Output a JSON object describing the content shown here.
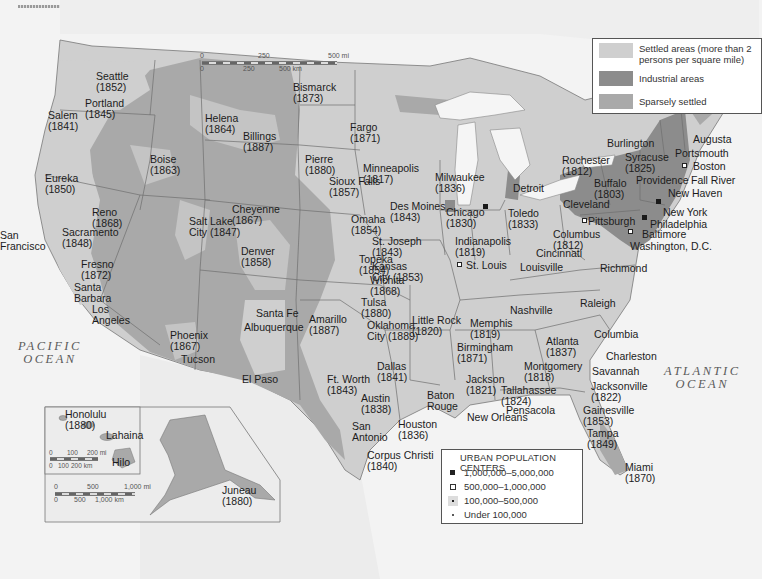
{
  "map": {
    "subject": "United States urban population centers and settlement",
    "colors": {
      "background": "#f3f3f3",
      "land_foreign": "#e8e8e8",
      "settled": "#cfcfcf",
      "industrial": "#8c8c8c",
      "sparsely": "#a9a9a9",
      "borders": "#6f6f6f",
      "lakes": "#f5f5f5"
    }
  },
  "oceans": {
    "pacific": "PACIFIC\nOCEAN",
    "atlantic": "ATLANTIC\nOCEAN"
  },
  "legend_settlement": {
    "items": [
      {
        "label": "Settled areas (more than 2\npersons per square mile)",
        "swatch": "#cfcfcf"
      },
      {
        "label": "Industrial areas",
        "swatch": "#8c8c8c"
      },
      {
        "label": "Sparsely settled",
        "swatch": "#a9a9a9"
      }
    ]
  },
  "legend_urban": {
    "title": "URBAN POPULATION CENTERS",
    "items": [
      {
        "label": "1,000,000–5,000,000",
        "symbol": "filled-square"
      },
      {
        "label": "500,000–1,000,000",
        "symbol": "open-square"
      },
      {
        "label": "100,000–500,000",
        "symbol": "dot-in-square"
      },
      {
        "label": "Under 100,000",
        "symbol": "dot"
      }
    ]
  },
  "scale_main": {
    "mi_ticks": [
      "0",
      "250",
      "500 mi"
    ],
    "km_ticks": [
      "0",
      "250",
      "500 km"
    ]
  },
  "inset_hawaii": {
    "mi_ticks": [
      "0",
      "100",
      "200 mi"
    ],
    "km_ticks": [
      "0",
      "100",
      "200 km"
    ]
  },
  "inset_alaska": {
    "mi_ticks": [
      "0",
      "500",
      "1,000 mi"
    ],
    "km_ticks": [
      "0",
      "500",
      "1,000 km"
    ]
  },
  "cities": [
    {
      "name": "Seattle\n(1852)",
      "x": 96,
      "y": 71
    },
    {
      "name": "Portland\n(1845)",
      "x": 85,
      "y": 98
    },
    {
      "name": "Salem\n(1841)",
      "x": 48,
      "y": 110
    },
    {
      "name": "Eureka\n(1850)",
      "x": 45,
      "y": 173
    },
    {
      "name": "Boise\n(1863)",
      "x": 150,
      "y": 154
    },
    {
      "name": "Helena\n(1864)",
      "x": 205,
      "y": 113
    },
    {
      "name": "Billings\n(1887)",
      "x": 243,
      "y": 131
    },
    {
      "name": "Bismarck\n(1873)",
      "x": 293,
      "y": 82
    },
    {
      "name": "Fargo\n(1871)",
      "x": 350,
      "y": 122
    },
    {
      "name": "Pierre\n(1880)",
      "x": 305,
      "y": 154
    },
    {
      "name": "Sioux Falls\n(1857)",
      "x": 329,
      "y": 176
    },
    {
      "name": "Minneapolis\n(1817)",
      "x": 363,
      "y": 163
    },
    {
      "name": "Milwaukee\n(1836)",
      "x": 435,
      "y": 172
    },
    {
      "name": "Des Moines\n(1843)",
      "x": 390,
      "y": 201
    },
    {
      "name": "Omaha\n(1854)",
      "x": 351,
      "y": 214
    },
    {
      "name": "Chicago\n(1830)",
      "x": 446,
      "y": 207
    },
    {
      "name": "Detroit",
      "x": 513,
      "y": 183
    },
    {
      "name": "Toledo\n(1833)",
      "x": 508,
      "y": 208
    },
    {
      "name": "Cleveland",
      "x": 563,
      "y": 199
    },
    {
      "name": "Rochester\n(1812)",
      "x": 562,
      "y": 155
    },
    {
      "name": "Buffalo\n(1803)",
      "x": 594,
      "y": 178
    },
    {
      "name": "Syracuse\n(1825)",
      "x": 625,
      "y": 152
    },
    {
      "name": "Burlington",
      "x": 607,
      "y": 138
    },
    {
      "name": "Augusta",
      "x": 693,
      "y": 134
    },
    {
      "name": "Portsmouth",
      "x": 675,
      "y": 148
    },
    {
      "name": "Boston",
      "x": 693,
      "y": 161
    },
    {
      "name": "Fall River",
      "x": 691,
      "y": 175
    },
    {
      "name": "Providence",
      "x": 636,
      "y": 175
    },
    {
      "name": "New Haven",
      "x": 668,
      "y": 188
    },
    {
      "name": "New York",
      "x": 663,
      "y": 207
    },
    {
      "name": "Philadelphia",
      "x": 650,
      "y": 219
    },
    {
      "name": "Pittsburgh",
      "x": 588,
      "y": 216
    },
    {
      "name": "Baltimore",
      "x": 642,
      "y": 229
    },
    {
      "name": "Washington, D.C.",
      "x": 630,
      "y": 241
    },
    {
      "name": "Columbus\n(1812)",
      "x": 553,
      "y": 229
    },
    {
      "name": "Indianapolis\n(1819)",
      "x": 455,
      "y": 236
    },
    {
      "name": "Cincinnati",
      "x": 536,
      "y": 248
    },
    {
      "name": "Louisville",
      "x": 520,
      "y": 262
    },
    {
      "name": "Richmond",
      "x": 600,
      "y": 263
    },
    {
      "name": "St. Joseph\n(1843)",
      "x": 372,
      "y": 236
    },
    {
      "name": "St. Louis",
      "x": 466,
      "y": 260
    },
    {
      "name": "Kansas\nCity (1853)",
      "x": 372,
      "y": 261
    },
    {
      "name": "Topeka\n(1854)",
      "x": 359,
      "y": 254
    },
    {
      "name": "Wichita\n(1868)",
      "x": 370,
      "y": 275
    },
    {
      "name": "Cheyenne\n(1867)",
      "x": 232,
      "y": 204
    },
    {
      "name": "Salt Lake\nCity (1847)",
      "x": 189,
      "y": 216
    },
    {
      "name": "Denver\n(1858)",
      "x": 241,
      "y": 246
    },
    {
      "name": "Reno\n(1868)",
      "x": 92,
      "y": 207
    },
    {
      "name": "Sacramento\n(1848)",
      "x": 62,
      "y": 227
    },
    {
      "name": "San\nFrancisco",
      "x": 0,
      "y": 230
    },
    {
      "name": "Fresno\n(1872)",
      "x": 81,
      "y": 259
    },
    {
      "name": "Santa\nBarbara",
      "x": 74,
      "y": 282
    },
    {
      "name": "Los\nAngeles",
      "x": 92,
      "y": 304
    },
    {
      "name": "Santa Fe",
      "x": 256,
      "y": 308
    },
    {
      "name": "Albuquerque",
      "x": 244,
      "y": 322
    },
    {
      "name": "Phoenix\n(1867)",
      "x": 170,
      "y": 330
    },
    {
      "name": "Tucson",
      "x": 181,
      "y": 354
    },
    {
      "name": "El Paso",
      "x": 242,
      "y": 374
    },
    {
      "name": "Amarillo\n(1887)",
      "x": 309,
      "y": 314
    },
    {
      "name": "Tulsa\n(1880)",
      "x": 361,
      "y": 297
    },
    {
      "name": "Oklahoma\nCity (1889)",
      "x": 367,
      "y": 320
    },
    {
      "name": "Little Rock\n(1820)",
      "x": 412,
      "y": 315
    },
    {
      "name": "Memphis\n(1819)",
      "x": 470,
      "y": 318
    },
    {
      "name": "Nashville",
      "x": 510,
      "y": 305
    },
    {
      "name": "Raleigh",
      "x": 580,
      "y": 298
    },
    {
      "name": "Birmingham\n(1871)",
      "x": 457,
      "y": 342
    },
    {
      "name": "Atlanta\n(1837)",
      "x": 546,
      "y": 336
    },
    {
      "name": "Columbia",
      "x": 594,
      "y": 329
    },
    {
      "name": "Charleston",
      "x": 606,
      "y": 351
    },
    {
      "name": "Savannah",
      "x": 592,
      "y": 366
    },
    {
      "name": "Montgomery\n(1818)",
      "x": 524,
      "y": 361
    },
    {
      "name": "Jackson\n(1821)",
      "x": 466,
      "y": 374
    },
    {
      "name": "Tallahassee\n(1824)",
      "x": 501,
      "y": 385
    },
    {
      "name": "Jacksonville\n(1822)",
      "x": 591,
      "y": 381
    },
    {
      "name": "Pensacola",
      "x": 506,
      "y": 405
    },
    {
      "name": "Gainesville\n(1853)",
      "x": 583,
      "y": 405
    },
    {
      "name": "Tampa\n(1849)",
      "x": 587,
      "y": 428
    },
    {
      "name": "Miami\n(1870)",
      "x": 625,
      "y": 462
    },
    {
      "name": "Ft. Worth\n(1843)",
      "x": 327,
      "y": 374
    },
    {
      "name": "Dallas\n(1841)",
      "x": 377,
      "y": 361
    },
    {
      "name": "Austin\n(1838)",
      "x": 361,
      "y": 393
    },
    {
      "name": "Baton\nRouge",
      "x": 427,
      "y": 390
    },
    {
      "name": "New Orleans",
      "x": 467,
      "y": 412
    },
    {
      "name": "San\nAntonio",
      "x": 352,
      "y": 421
    },
    {
      "name": "Houston\n(1836)",
      "x": 398,
      "y": 419
    },
    {
      "name": "Corpus Christi\n(1840)",
      "x": 367,
      "y": 450
    },
    {
      "name": "Honolulu\n(1880)",
      "x": 65,
      "y": 409
    },
    {
      "name": "Lahaina",
      "x": 106,
      "y": 430
    },
    {
      "name": "Hilo",
      "x": 112,
      "y": 457
    },
    {
      "name": "Juneau\n(1880)",
      "x": 222,
      "y": 485
    }
  ]
}
